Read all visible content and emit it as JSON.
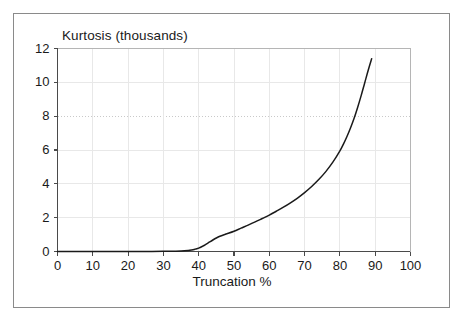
{
  "chart_data": {
    "type": "line",
    "title": "Kurtosis (thousands)",
    "xlabel": "Truncation %",
    "ylabel": "",
    "xlim": [
      0,
      100
    ],
    "ylim": [
      0,
      12
    ],
    "xticks": [
      0,
      10,
      20,
      30,
      40,
      50,
      60,
      70,
      80,
      90,
      100
    ],
    "yticks": [
      0,
      2,
      4,
      6,
      8,
      10,
      12
    ],
    "xtick_labels": [
      "0",
      "10",
      "20",
      "30",
      "40",
      "50",
      "60",
      "70",
      "80",
      "90",
      "100"
    ],
    "ytick_labels": [
      "0",
      "2",
      "4",
      "6",
      "8",
      "10",
      "12"
    ],
    "grid": true,
    "grid_style": "faint solid, dotted at y=8",
    "legend": null,
    "series": [
      {
        "name": "Kurtosis",
        "color": "#1a1a1a",
        "x": [
          0,
          5,
          10,
          15,
          20,
          25,
          30,
          33,
          35,
          37,
          38,
          39,
          40,
          41,
          42,
          43,
          44,
          45,
          46,
          47,
          48,
          50,
          52,
          54,
          56,
          58,
          60,
          62,
          64,
          66,
          68,
          70,
          72,
          74,
          76,
          78,
          80,
          81,
          82,
          83,
          84,
          85,
          86,
          87,
          88,
          89
        ],
        "y": [
          0,
          0,
          0,
          0,
          0,
          0,
          0.01,
          0.02,
          0.03,
          0.06,
          0.09,
          0.14,
          0.2,
          0.3,
          0.42,
          0.55,
          0.68,
          0.8,
          0.9,
          0.98,
          1.05,
          1.2,
          1.38,
          1.56,
          1.75,
          1.95,
          2.15,
          2.38,
          2.62,
          2.88,
          3.16,
          3.48,
          3.84,
          4.25,
          4.72,
          5.28,
          5.95,
          6.35,
          6.8,
          7.3,
          7.86,
          8.5,
          9.2,
          9.95,
          10.7,
          11.4
        ]
      }
    ],
    "annotations": []
  },
  "figure": {
    "background": "#ffffff",
    "frame_color": "#8a8a8a",
    "axis_color": "#555555",
    "grid_color": "#e8e8e8",
    "text_color": "#1a1a1a"
  }
}
